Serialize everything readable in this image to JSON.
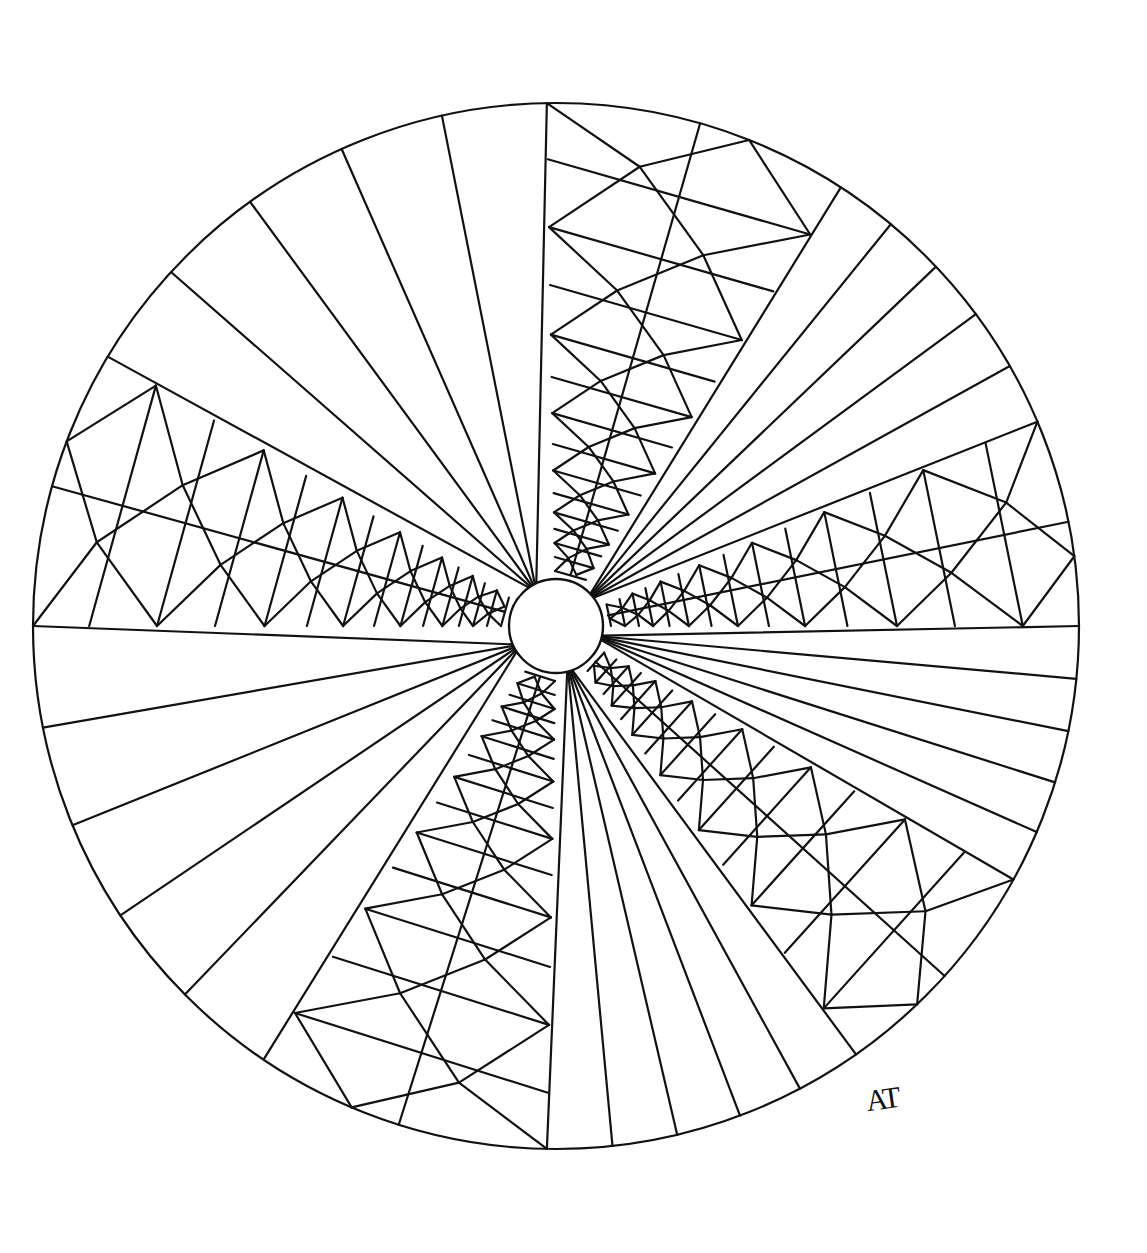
{
  "artwork": {
    "type": "mandala line-art coloring page",
    "signature": "AT",
    "colors": {
      "stroke": "#111111",
      "background": "#ffffff"
    },
    "geometry": {
      "center": [
        556,
        626
      ],
      "outer_radius": 523,
      "inner_radius": 47,
      "sectors": [
        {
          "kind": "rays",
          "start_deg": -149,
          "end_deg": -91,
          "rays": 5
        },
        {
          "kind": "lattice",
          "start_deg": -91,
          "end_deg": -57
        },
        {
          "kind": "rays",
          "start_deg": -57,
          "end_deg": -23,
          "rays": 5
        },
        {
          "kind": "lattice",
          "start_deg": -23,
          "end_deg": 0
        },
        {
          "kind": "rays",
          "start_deg": 0,
          "end_deg": 29,
          "rays": 5
        },
        {
          "kind": "lattice",
          "start_deg": 29,
          "end_deg": 55
        },
        {
          "kind": "rays",
          "start_deg": 55,
          "end_deg": 91,
          "rays": 5
        },
        {
          "kind": "lattice",
          "start_deg": 91,
          "end_deg": 124
        },
        {
          "kind": "rays",
          "start_deg": 124,
          "end_deg": 180,
          "rays": 5
        },
        {
          "kind": "lattice",
          "start_deg": 180,
          "end_deg": 211
        }
      ]
    }
  }
}
